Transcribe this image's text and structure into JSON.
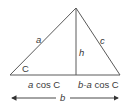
{
  "diagram": {
    "type": "triangle-with-altitude",
    "colors": {
      "line": "#5a5a5a",
      "text": "#3a3a3a",
      "background": "#ffffff"
    },
    "vertices": {
      "apex": {
        "x": 76,
        "y": 8
      },
      "left": {
        "x": 10,
        "y": 75
      },
      "right": {
        "x": 120,
        "y": 75
      },
      "altitude_foot": {
        "x": 76,
        "y": 75
      }
    },
    "labels": {
      "side_left": "a",
      "side_right": "c",
      "altitude": "h",
      "angle": "C",
      "base_left_segment": "a cos C",
      "base_right_segment": "b-a cos C",
      "base_total": "b"
    }
  }
}
